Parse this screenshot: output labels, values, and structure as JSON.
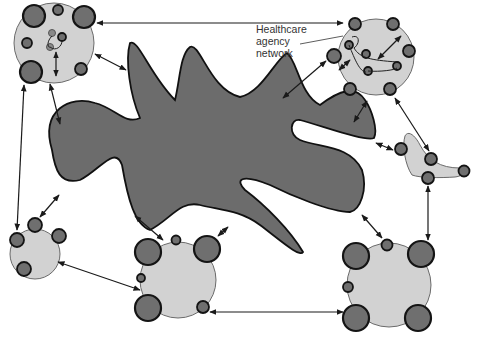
{
  "diagram": {
    "label": {
      "line1": "Healthcare",
      "line2": "agency",
      "line3": "network"
    },
    "colors": {
      "background": "#ffffff",
      "cluster_fill": "#d2d2d2",
      "node_fill": "#6f6f6f",
      "central_blob_fill": "#6c6c6c",
      "outline": "#141414"
    },
    "clusters": [
      {
        "id": "top-left",
        "nodes": 7,
        "has_inner_network": true
      },
      {
        "id": "top-right-healthcare-agency",
        "nodes": 10,
        "has_inner_network": true
      },
      {
        "id": "right-crescent",
        "nodes": 4
      },
      {
        "id": "left",
        "nodes": 4
      },
      {
        "id": "bottom-center",
        "nodes": 6
      },
      {
        "id": "bottom-right",
        "nodes": 6
      }
    ],
    "central_entity": "community-blob"
  }
}
